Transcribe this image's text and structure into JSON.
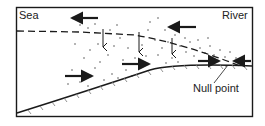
{
  "labels": {
    "sea": "Sea",
    "river": "River",
    "null_point": "Null point"
  },
  "colors": {
    "stroke": "#1a1a1a",
    "background": "#ffffff",
    "hatch": "#777777"
  },
  "elements": {
    "frame": "diagram-frame",
    "saltwater_wedge_boundary": "dashed-halocline-line",
    "seabed": "hatched-bed-profile",
    "sediment": "stippled-suspended-sediment",
    "surface_flow": "seaward-arrows",
    "settling": "downward-arrows",
    "bottom_flow": "landward-arrows",
    "convergence": "null-point-convergence"
  },
  "arrows": {
    "surface_seaward": [
      {
        "x1": 98,
        "y1": 18,
        "x2": 70,
        "y2": 18
      },
      {
        "x1": 196,
        "y1": 27,
        "x2": 167,
        "y2": 27
      }
    ],
    "settling_down": [
      {
        "x": 102,
        "y1": 29,
        "y2": 47
      },
      {
        "x": 139,
        "y1": 33,
        "y2": 52
      },
      {
        "x": 176,
        "y1": 36,
        "y2": 53
      }
    ],
    "bottom_landward": [
      {
        "x1": 65,
        "y1": 76,
        "x2": 94,
        "y2": 76
      },
      {
        "x1": 123,
        "y1": 63,
        "x2": 152,
        "y2": 63
      },
      {
        "x1": 197,
        "y1": 61,
        "x2": 220,
        "y2": 61
      }
    ],
    "river_seaward_at_null": [
      {
        "x1": 250,
        "y1": 60,
        "x2": 232,
        "y2": 60
      }
    ]
  }
}
